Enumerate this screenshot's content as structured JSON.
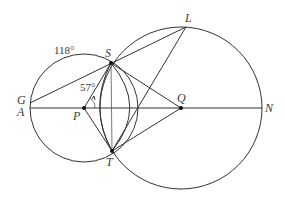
{
  "diagram": {
    "type": "geometry",
    "points": {
      "G": {
        "label": "G",
        "x": 30,
        "y": 103
      },
      "A": {
        "label": "A",
        "x": 30,
        "y": 108
      },
      "P": {
        "label": "P",
        "x": 84,
        "y": 108
      },
      "S": {
        "label": "S",
        "x": 111,
        "y": 63
      },
      "T": {
        "label": "T",
        "x": 112,
        "y": 151
      },
      "Q": {
        "label": "Q",
        "x": 181,
        "y": 108
      },
      "N": {
        "label": "N",
        "x": 262,
        "y": 108
      },
      "L": {
        "label": "L",
        "x": 186,
        "y": 27
      }
    },
    "circles": [
      {
        "name": "circle-P",
        "center": "P",
        "radius": 54
      },
      {
        "name": "circle-Q",
        "center": "Q",
        "radius": 81
      }
    ],
    "annotations": {
      "arc_GS": "118°",
      "angle_SPQ": "57°"
    },
    "segments": [
      "G-L",
      "A-N",
      "P-S",
      "P-T",
      "S-T",
      "S-Q",
      "T-Q",
      "T-L"
    ]
  }
}
